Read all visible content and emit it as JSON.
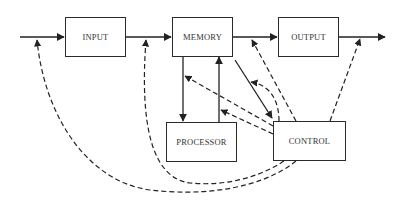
{
  "diagram": {
    "type": "block-diagram",
    "nodes": [
      {
        "id": "input",
        "label": "INPUT"
      },
      {
        "id": "memory",
        "label": "MEMORY"
      },
      {
        "id": "output",
        "label": "OUTPUT"
      },
      {
        "id": "processor",
        "label": "PROCESSOR"
      },
      {
        "id": "control",
        "label": "CONTROL"
      }
    ],
    "edges": [
      {
        "from": "external",
        "to": "input",
        "style": "solid"
      },
      {
        "from": "input",
        "to": "memory",
        "style": "solid"
      },
      {
        "from": "memory",
        "to": "output",
        "style": "solid"
      },
      {
        "from": "output",
        "to": "external",
        "style": "solid"
      },
      {
        "from": "memory",
        "to": "processor",
        "style": "solid"
      },
      {
        "from": "processor",
        "to": "memory",
        "style": "solid"
      },
      {
        "from": "memory",
        "to": "control",
        "style": "solid"
      },
      {
        "from": "control",
        "to": "external-input-line",
        "style": "dashed"
      },
      {
        "from": "control",
        "to": "input-memory-line",
        "style": "dashed"
      },
      {
        "from": "control",
        "to": "memory-output-line",
        "style": "dashed"
      },
      {
        "from": "control",
        "to": "output-external-line",
        "style": "dashed"
      },
      {
        "from": "control",
        "to": "memory-processor-line",
        "style": "dashed"
      },
      {
        "from": "control",
        "to": "processor-memory-line",
        "style": "dashed"
      },
      {
        "from": "control",
        "to": "memory-control-line",
        "style": "dashed"
      }
    ]
  },
  "colors": {
    "line": "#222222",
    "text": "#333333",
    "background": "#ffffff"
  }
}
